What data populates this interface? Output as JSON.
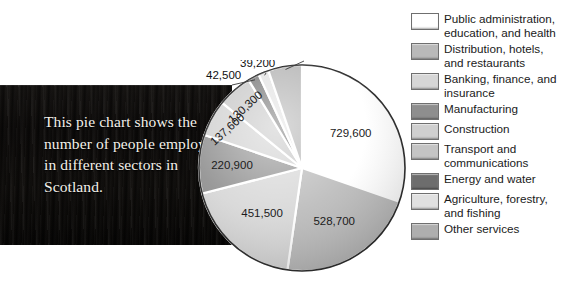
{
  "caption": {
    "text": "This pie chart shows the number of people employed in different sectors in Scotland."
  },
  "chart_data": {
    "type": "pie",
    "title": "",
    "subtitle": "",
    "xlabel": "",
    "ylabel": "",
    "units": "people employed",
    "total": 2407300,
    "legend_position": "right",
    "grid": false,
    "start_angle_deg": 0,
    "direction": "clockwise",
    "categories": [
      "Public administration, education, and health",
      "Distribution, hotels, and restaurants",
      "Banking, finance, and insurance",
      "Manufacturing",
      "Construction",
      "Transport and communications",
      "Energy and water",
      "Agriculture, forestry, and fishing",
      "Other services"
    ],
    "values": [
      729600,
      528700,
      451500,
      220900,
      137600,
      130300,
      42500,
      39200,
      127300
    ],
    "value_labels": [
      "729,600",
      "528,700",
      "451,500",
      "220,900",
      "137,600",
      "130,300",
      "42,500",
      "39,200",
      "127,300"
    ],
    "colors": [
      "#ffffff",
      "#b9b9b9",
      "#d6d6d6",
      "#8e8e8e",
      "#cfcfcf",
      "#c4c4c4",
      "#6d6d6d",
      "#e0e0e0",
      "#aeaeae"
    ],
    "angles_deg": [
      109.1,
      79.1,
      67.5,
      33.0,
      20.6,
      19.5,
      6.4,
      5.9,
      19.0
    ],
    "callout_labels": [
      "42,500",
      "39,200",
      "127,300"
    ]
  },
  "legend": {
    "items": [
      {
        "label": "Public administration,\neducation, and health",
        "color": "#ffffff",
        "name": "public-administration"
      },
      {
        "label": "Distribution, hotels,\nand restaurants",
        "color": "#b9b9b9",
        "name": "distribution-hotels"
      },
      {
        "label": "Banking, finance, and\ninsurance",
        "color": "#d6d6d6",
        "name": "banking-finance"
      },
      {
        "label": "Manufacturing",
        "color": "#8e8e8e",
        "name": "manufacturing"
      },
      {
        "label": "Construction",
        "color": "#cfcfcf",
        "name": "construction"
      },
      {
        "label": "Transport and\ncommunications",
        "color": "#c4c4c4",
        "name": "transport-communications"
      },
      {
        "label": "Energy and water",
        "color": "#6d6d6d",
        "name": "energy-water"
      },
      {
        "label": "Agriculture, forestry,\nand fishing",
        "color": "#e0e0e0",
        "name": "agriculture-forestry"
      },
      {
        "label": "Other services",
        "color": "#aeaeae",
        "name": "other-services"
      }
    ]
  },
  "pie_geometry": {
    "cx": 106,
    "cy": 108,
    "r": 103
  }
}
